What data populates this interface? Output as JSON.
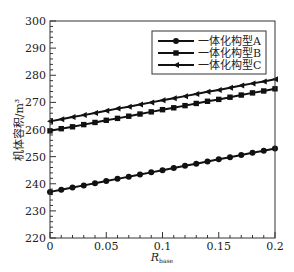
{
  "chart_data": {
    "type": "line",
    "title": "",
    "xlabel": "R",
    "xlabel_sub": "base",
    "ylabel": "机体容积/m³",
    "xlim": [
      0,
      0.2
    ],
    "ylim": [
      220,
      300
    ],
    "xticks": [
      0,
      0.05,
      0.1,
      0.15,
      0.2
    ],
    "xtick_labels": [
      "0",
      "0.05",
      "0.1",
      "0.15",
      "0.2"
    ],
    "yticks": [
      220,
      230,
      240,
      250,
      260,
      270,
      280,
      290,
      300
    ],
    "ytick_labels": [
      "220",
      "230",
      "240",
      "250",
      "260",
      "270",
      "280",
      "290",
      "300"
    ],
    "grid": false,
    "legend_position": "upper right",
    "x": [
      0,
      0.01,
      0.02,
      0.03,
      0.04,
      0.05,
      0.06,
      0.07,
      0.08,
      0.09,
      0.1,
      0.11,
      0.12,
      0.13,
      0.14,
      0.15,
      0.16,
      0.17,
      0.18,
      0.19,
      0.2
    ],
    "series": [
      {
        "name": "一体化构型A",
        "marker": "circle",
        "values": [
          237.0,
          237.8,
          238.6,
          239.4,
          240.2,
          241.0,
          241.8,
          242.6,
          243.4,
          244.2,
          245.0,
          245.8,
          246.6,
          247.4,
          248.2,
          249.0,
          249.8,
          250.6,
          251.4,
          252.2,
          253.0
        ]
      },
      {
        "name": "一体化构型B",
        "marker": "square",
        "values": [
          259.5,
          260.3,
          261.0,
          261.8,
          262.6,
          263.4,
          264.1,
          264.9,
          265.7,
          266.5,
          267.3,
          268.0,
          268.8,
          269.6,
          270.4,
          271.1,
          271.9,
          272.7,
          273.5,
          274.2,
          275.0
        ]
      },
      {
        "name": "一体化构型C",
        "marker": "triangle-left",
        "values": [
          263.0,
          263.8,
          264.6,
          265.3,
          266.1,
          266.9,
          267.7,
          268.4,
          269.2,
          270.0,
          270.8,
          271.5,
          272.3,
          273.1,
          273.9,
          274.6,
          275.4,
          276.2,
          277.0,
          277.7,
          278.5
        ]
      }
    ]
  },
  "colors": {
    "line": "#111111",
    "axis": "#333333",
    "background": "#ffffff"
  }
}
